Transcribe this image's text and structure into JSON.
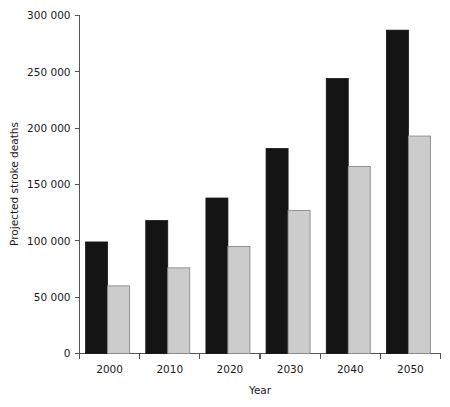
{
  "chart_data": {
    "type": "bar",
    "title": "",
    "subtitle": "",
    "xlabel": "Year",
    "ylabel": "Projected stroke deaths",
    "categories": [
      "2000",
      "2010",
      "2020",
      "2030",
      "2040",
      "2050"
    ],
    "series": [
      {
        "name": "series-dark",
        "color": "#141414",
        "values": [
          99000,
          118000,
          138000,
          182000,
          244000,
          287000
        ]
      },
      {
        "name": "series-light",
        "color": "#cccccc",
        "values": [
          60000,
          76000,
          95000,
          127000,
          166000,
          193000
        ]
      }
    ],
    "ylim": [
      0,
      300000
    ],
    "xlim_note": "categorical, ticks at group boundaries",
    "yticks": [
      0,
      50000,
      100000,
      150000,
      200000,
      250000,
      300000
    ],
    "ytick_labels": [
      "0",
      "50 000",
      "100 000",
      "150 000",
      "200 000",
      "250 000",
      "300 000"
    ],
    "xtick_labels": [
      "2000",
      "2010",
      "2020",
      "2030",
      "2040",
      "2050"
    ],
    "grid": false,
    "legend": false,
    "legend_position": "none",
    "annotations": []
  }
}
